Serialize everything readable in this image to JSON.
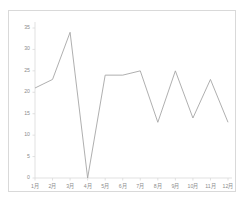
{
  "chart_data": {
    "type": "line",
    "title": "",
    "xlabel": "",
    "ylabel": "",
    "categories": [
      "1月",
      "2月",
      "3月",
      "4月",
      "5月",
      "6月",
      "7月",
      "8月",
      "9月",
      "10月",
      "11月",
      "12月"
    ],
    "values": [
      21,
      23,
      34,
      0,
      24,
      24,
      25,
      13,
      25,
      14,
      23,
      13
    ],
    "series": [
      {
        "name": "",
        "values": [
          21,
          23,
          34,
          0,
          24,
          24,
          25,
          13,
          25,
          14,
          23,
          13
        ]
      }
    ],
    "ylim": [
      0,
      35
    ],
    "yticks": [
      0,
      5,
      10,
      15,
      20,
      25,
      30,
      35
    ],
    "ytick_labels": [
      "0",
      "5",
      "10",
      "15",
      "20",
      "25",
      "30",
      "35"
    ],
    "grid": false,
    "legend": false,
    "legend_position": "none",
    "markers": false,
    "line_color": "#a6a6a6",
    "axis_color": "#d9d9d9",
    "tick_text_color": "#8c8c8c",
    "background_color": "#ffffff"
  }
}
